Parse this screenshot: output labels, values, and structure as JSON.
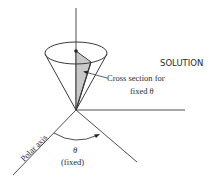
{
  "heading": "SOLUTION",
  "labels": {
    "cross_section_line1": "Cross section for",
    "cross_section_line2": "fixed θ",
    "polar_axis": "Polar axis",
    "theta": "θ",
    "fixed": "(fixed)"
  },
  "colors": {
    "line": "#3a3a3a",
    "shade": "#c9c9c9",
    "text": "#2a2a2a",
    "background": "#ffffff"
  }
}
